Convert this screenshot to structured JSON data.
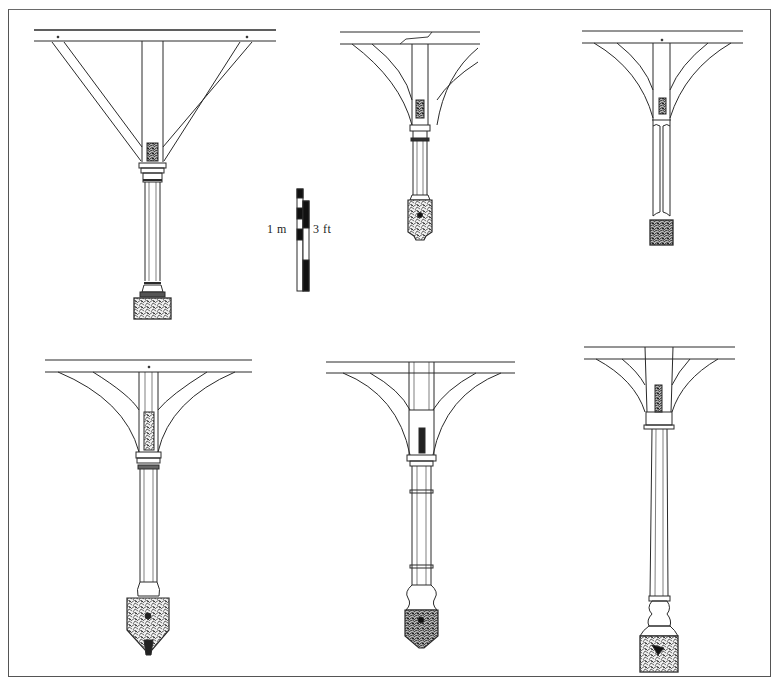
{
  "figure": {
    "type": "architectural elevation drawings",
    "panel_count": 6,
    "colors": {
      "ink": "#2a2a2a",
      "paper": "#ffffff",
      "frame": "#555555"
    }
  },
  "scale_bar": {
    "metric_label": "1 m",
    "imperial_label": "3 ft"
  },
  "panels": [
    {
      "id": "top-left",
      "row": 1,
      "col": 1,
      "description": "column with straight diagonal ribs and rectangular base"
    },
    {
      "id": "top-middle",
      "row": 1,
      "col": 2,
      "description": "column with curved ribs and pendant base"
    },
    {
      "id": "top-right",
      "row": 1,
      "col": 3,
      "description": "split column with curved ribs and square base"
    },
    {
      "id": "bottom-left",
      "row": 2,
      "col": 1,
      "description": "column with curved ribs and pointed pendant base"
    },
    {
      "id": "bottom-middle",
      "row": 2,
      "col": 2,
      "description": "banded column with curved ribs and pendant base"
    },
    {
      "id": "bottom-right",
      "row": 2,
      "col": 3,
      "description": "tall column with curved ribs and square base"
    }
  ]
}
